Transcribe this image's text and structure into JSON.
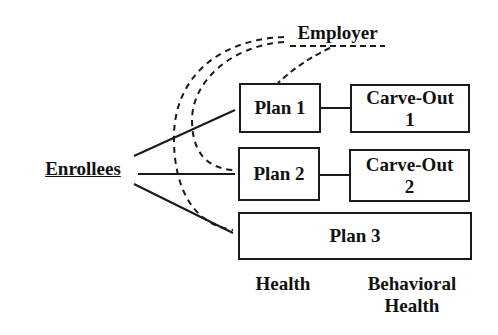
{
  "diagram": {
    "source_node": {
      "label": "Enrollees"
    },
    "employer_node": {
      "label": "Employer"
    },
    "plans": [
      {
        "label": "Plan 1"
      },
      {
        "label": "Plan 2"
      },
      {
        "label": "Plan 3"
      }
    ],
    "carve_outs": [
      {
        "line1": "Carve-Out",
        "line2": "1"
      },
      {
        "line1": "Carve-Out",
        "line2": "2"
      }
    ],
    "column_headers": {
      "health": "Health",
      "behavioral_line1": "Behavioral",
      "behavioral_line2": "Health"
    },
    "colors": {
      "stroke": "#1a1a1a",
      "background": "#ffffff"
    }
  }
}
